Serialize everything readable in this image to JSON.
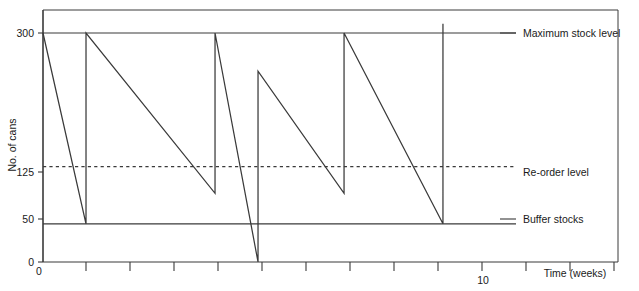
{
  "chart_data": {
    "type": "line",
    "title": "",
    "subtitle": "",
    "xlabel": "Time (weeks)",
    "ylabel": "No. of cans",
    "xlim": [
      0,
      13.37
    ],
    "ylim": [
      0,
      300
    ],
    "grid": false,
    "legend_position": "right-inline-labels",
    "x_tick_labels": [
      "0",
      "10"
    ],
    "x_tick_values": [
      0,
      10
    ],
    "x_minor_tick_values": [
      1,
      2,
      3,
      4,
      5,
      6,
      7,
      8,
      9,
      11,
      12,
      13
    ],
    "y_tick_labels": [
      "0",
      "50",
      "125",
      "300"
    ],
    "y_tick_values": [
      0,
      50,
      125,
      300
    ],
    "series": [
      {
        "name": "Stock level",
        "style": "solid",
        "color": "#3a3a3a",
        "x": [
          0,
          1,
          1,
          4,
          4,
          5,
          5,
          7,
          7,
          9.3,
          9.3
        ],
        "y": [
          300,
          50,
          300,
          90,
          300,
          0,
          250,
          90,
          300,
          50,
          312
        ]
      }
    ],
    "reference_lines": [
      {
        "name": "maximum-stock-level",
        "label": "Maximum stock level",
        "value": 300,
        "style": "solid",
        "color": "#3a3a3a"
      },
      {
        "name": "re-order-level",
        "label": "Re-order level",
        "value": 125,
        "style": "dashed",
        "color": "#3a3a3a"
      },
      {
        "name": "buffer-stocks",
        "label": "Buffer stocks",
        "value": 50,
        "style": "solid",
        "color": "#3a3a3a"
      }
    ]
  },
  "axes": {
    "y_label": "No. of cans",
    "x_label": "Time (weeks)",
    "y_ticks": {
      "t300": "300",
      "t125": "125",
      "t50": "50",
      "t0": "0"
    },
    "x_ticks": {
      "t0": "0",
      "t10": "10"
    }
  },
  "annotations": {
    "maximum_stock_level": "Maximum stock level",
    "re_order_level": "Re-order level",
    "buffer_stocks": "Buffer stocks"
  },
  "colors": {
    "line": "#3a3a3a",
    "axis": "#3a3a3a",
    "text": "#1a1a1a",
    "background": "#ffffff"
  }
}
